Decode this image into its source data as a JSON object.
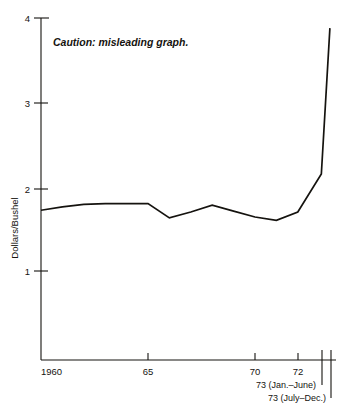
{
  "chart_data": {
    "type": "line",
    "title": "",
    "subtitle": "",
    "xlabel": "",
    "ylabel": "Dollars/Bushel",
    "ylim": [
      0.55,
      4.0
    ],
    "xlim": [
      1960,
      1973.75
    ],
    "grid": false,
    "legend": "none",
    "y_ticks": [
      {
        "value": 4,
        "label": "4"
      },
      {
        "value": 3,
        "label": "3"
      },
      {
        "value": 2,
        "label": "2"
      },
      {
        "value": 1,
        "label": "1"
      }
    ],
    "x_ticks": [
      {
        "value": 1960,
        "label": "1960"
      },
      {
        "value": 1965,
        "label": "65"
      },
      {
        "value": 1970,
        "label": "70"
      },
      {
        "value": 1972,
        "label": "72"
      },
      {
        "value": 1973.1,
        "label": ""
      },
      {
        "value": 1973.5,
        "label": ""
      }
    ],
    "x_extra_labels": [
      {
        "label": "73 (Jan.–June)"
      },
      {
        "label": "73 (July–Dec.)"
      }
    ],
    "annotations": [
      {
        "text": "Caution: misleading graph.",
        "x": 1961.0,
        "y": 3.66
      }
    ],
    "x": [
      1960,
      1961,
      1962,
      1963,
      1964,
      1965,
      1966,
      1967,
      1968,
      1969,
      1970,
      1971,
      1972,
      1973.1,
      1973.5
    ],
    "values": [
      1.72,
      1.76,
      1.79,
      1.8,
      1.8,
      1.8,
      1.63,
      1.7,
      1.78,
      1.71,
      1.64,
      1.6,
      1.7,
      2.15,
      3.88
    ],
    "series": [
      {
        "name": "Wheat price",
        "values": [
          1.72,
          1.76,
          1.79,
          1.8,
          1.8,
          1.8,
          1.63,
          1.7,
          1.78,
          1.71,
          1.64,
          1.6,
          1.7,
          2.15,
          3.88
        ]
      }
    ]
  },
  "labels": {
    "y_axis_title": "Dollars/Bushel",
    "caution_note": "Caution: misleading graph.",
    "y_4": "4",
    "y_3": "3",
    "y_2": "2",
    "y_1": "1",
    "x_1960": "1960",
    "x_65": "65",
    "x_70": "70",
    "x_72": "72",
    "x_73_first_half": "73 (Jan.–June)",
    "x_73_second_half": "73 (July–Dec.)"
  },
  "colors": {
    "ink": "#15130f",
    "background": "#ffffff"
  }
}
